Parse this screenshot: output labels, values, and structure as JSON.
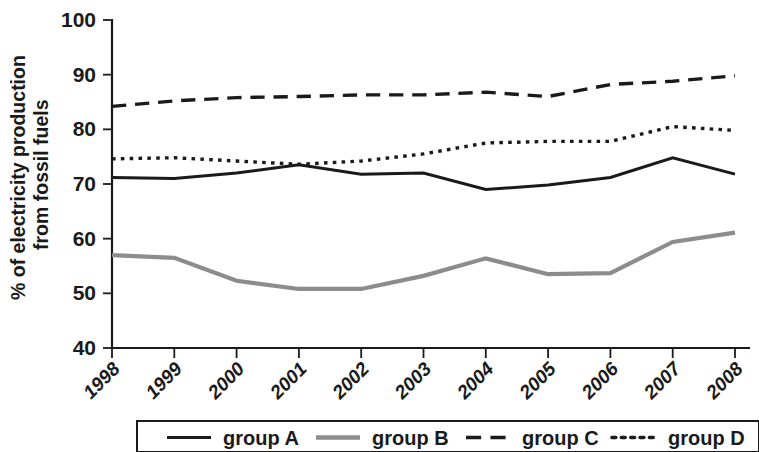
{
  "chart_data": {
    "type": "line",
    "title": "",
    "xlabel": "",
    "ylabel": "% of electricity production from fossil fuels",
    "ylabel_line1": "% of electricity production",
    "ylabel_line2": "from fossil fuels",
    "categories": [
      "1998",
      "1999",
      "2000",
      "2001",
      "2002",
      "2003",
      "2004",
      "2005",
      "2006",
      "2007",
      "2008"
    ],
    "x": [
      1998,
      1999,
      2000,
      2001,
      2002,
      2003,
      2004,
      2005,
      2006,
      2007,
      2008
    ],
    "ylim": [
      40,
      100
    ],
    "yticks": [
      40,
      50,
      60,
      70,
      80,
      90,
      100
    ],
    "ytick_labels": [
      "40",
      "50",
      "60",
      "70",
      "80",
      "90",
      "100"
    ],
    "grid": false,
    "legend_position": "bottom",
    "series": [
      {
        "name": "group A",
        "style": "solid",
        "color": "#1a1a1a",
        "values": [
          71.2,
          71.0,
          72.0,
          73.5,
          71.8,
          72.0,
          69.0,
          69.8,
          71.2,
          74.8,
          71.8
        ]
      },
      {
        "name": "group B",
        "style": "solid",
        "color": "#8c8c8c",
        "values": [
          57.0,
          56.5,
          52.3,
          50.8,
          50.8,
          53.2,
          56.4,
          53.5,
          53.7,
          59.4,
          61.1
        ]
      },
      {
        "name": "group C",
        "style": "dashed",
        "color": "#1a1a1a",
        "values": [
          84.2,
          85.2,
          85.8,
          86.0,
          86.3,
          86.3,
          86.8,
          86.0,
          88.2,
          88.8,
          89.8
        ]
      },
      {
        "name": "group D",
        "style": "dotted",
        "color": "#1a1a1a",
        "values": [
          74.6,
          74.8,
          74.2,
          73.6,
          74.2,
          75.5,
          77.5,
          77.8,
          77.8,
          80.5,
          79.8
        ]
      }
    ]
  },
  "legend": {
    "items": [
      {
        "label": "group A",
        "style": "solid",
        "color": "#1a1a1a"
      },
      {
        "label": "group B",
        "style": "solid",
        "color": "#8c8c8c"
      },
      {
        "label": "group C",
        "style": "dashed",
        "color": "#1a1a1a"
      },
      {
        "label": "group D",
        "style": "dotted",
        "color": "#1a1a1a"
      }
    ]
  }
}
